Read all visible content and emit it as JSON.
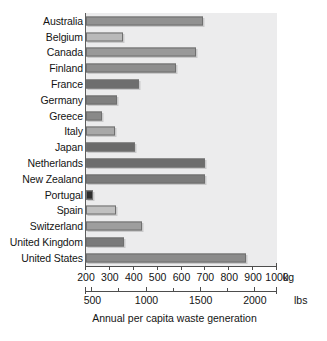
{
  "chart_data": {
    "type": "bar",
    "orientation": "horizontal",
    "title": "",
    "caption": "Annual per capita waste generation",
    "xlabel": "",
    "ylabel": "",
    "grid": false,
    "legend": false,
    "primary_unit": "kg",
    "secondary_unit": "lbs",
    "xlim": [
      200,
      1000
    ],
    "xlim_lbs": [
      440,
      2205
    ],
    "xticks": [
      200,
      300,
      400,
      500,
      600,
      700,
      800,
      900,
      1000
    ],
    "xticklabels": [
      "200",
      "300",
      "400",
      "500",
      "600",
      "700",
      "800",
      "900",
      "1000"
    ],
    "xticks_lbs": [
      500,
      1000,
      1500,
      2000
    ],
    "xticklabels_lbs": [
      "500",
      "1000",
      "1500",
      "2000"
    ],
    "xticks_lbs_minor": [
      750,
      1250,
      1750
    ],
    "categories": [
      "Australia",
      "Belgium",
      "Canada",
      "Finland",
      "France",
      "Germany",
      "Greece",
      "Italy",
      "Japan",
      "Netherlands",
      "New Zealand",
      "Portugal",
      "Spain",
      "Switzerland",
      "United Kingdom",
      "United States"
    ],
    "values": [
      690,
      355,
      660,
      575,
      420,
      330,
      265,
      320,
      405,
      700,
      700,
      230,
      325,
      435,
      360,
      870
    ],
    "bar_colors": [
      "#919191",
      "#b9b9b9",
      "#999999",
      "#8e8e8e",
      "#6e6e6e",
      "#7f7f7f",
      "#898989",
      "#a8a8a8",
      "#6a6a6a",
      "#6d6d6d",
      "#7b7b7b",
      "#2e2e2e",
      "#c0c0c0",
      "#9e9e9e",
      "#7a7a7a",
      "#8b8b8b"
    ],
    "panel_background": "#ececed",
    "axis_color": "#4d4d4d"
  }
}
